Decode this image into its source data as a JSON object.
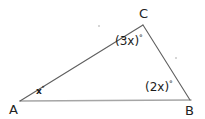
{
  "figure": {
    "background_color": "#ffffff",
    "stroke_color_light": "#9a9a9a",
    "stroke_color_dark": "#5a5a5a",
    "vertices": {
      "A": {
        "label": "A",
        "x": 20,
        "y": 101
      },
      "B": {
        "label": "B",
        "x": 190,
        "y": 101
      },
      "C": {
        "label": "C",
        "x": 143,
        "y": 25
      }
    },
    "sides": [
      {
        "name": "AB",
        "from": "A",
        "to": "B",
        "color": "#a6a6a6"
      },
      {
        "name": "AC",
        "from": "A",
        "to": "C",
        "color": "#5f5f5f"
      },
      {
        "name": "CB",
        "from": "C",
        "to": "B",
        "color": "#5f5f5f"
      }
    ],
    "angles": [
      {
        "at": "A",
        "expression": "x",
        "degree_symbol": "°",
        "text": "x°"
      },
      {
        "at": "C",
        "expression": "(3x)",
        "degree_symbol": "°",
        "text": "(3x)°"
      },
      {
        "at": "B",
        "expression": "(2x)",
        "degree_symbol": "°",
        "text": "(2x)°"
      }
    ]
  }
}
